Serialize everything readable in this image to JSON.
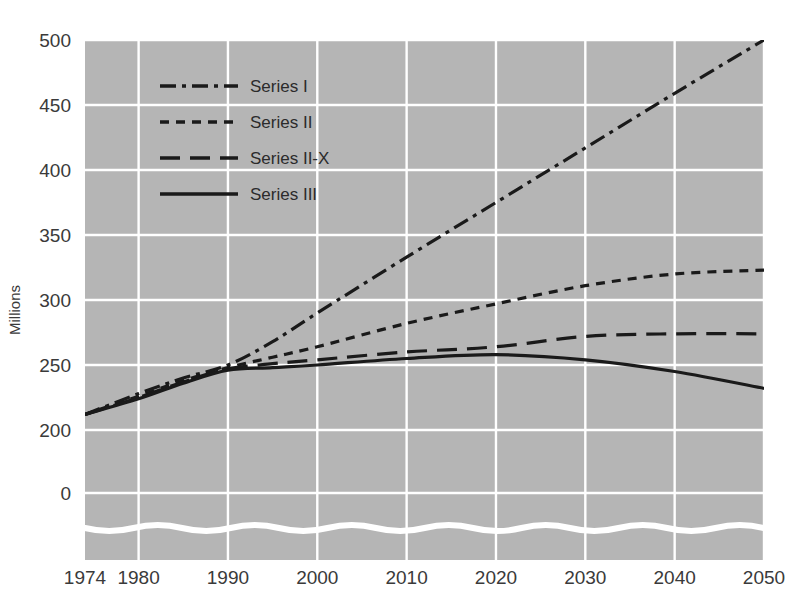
{
  "chart_data": {
    "type": "line",
    "title": "",
    "xlabel": "",
    "ylabel": "Millions",
    "xlim": [
      1974,
      2050
    ],
    "ylim": [
      190,
      500
    ],
    "yticks": [
      500,
      450,
      400,
      350,
      300,
      250,
      200,
      0
    ],
    "xticks": [
      1974,
      1980,
      1990,
      2000,
      2010,
      2020,
      2030,
      2040,
      2050
    ],
    "axis_break": true,
    "grid": true,
    "legend_position": "upper-left-inside",
    "plot_background": "#b5b5b5",
    "gridline_color": "#ffffff",
    "line_color": "#1a1a1a",
    "series": [
      {
        "name": "Series I",
        "dash_style": "dash-dot",
        "x": [
          1974,
          1980,
          1985,
          1990,
          1995,
          2000,
          2010,
          2020,
          2030,
          2040,
          2050
        ],
        "values": [
          212,
          228,
          240,
          250,
          268,
          290,
          333,
          375,
          417,
          459,
          500
        ]
      },
      {
        "name": "Series II",
        "dash_style": "short-dash",
        "x": [
          1974,
          1980,
          1985,
          1990,
          1995,
          2000,
          2010,
          2020,
          2030,
          2040,
          2050
        ],
        "values": [
          212,
          226,
          238,
          248,
          256,
          264,
          282,
          297,
          311,
          320,
          323
        ]
      },
      {
        "name": "Series II-X",
        "dash_style": "long-dash",
        "x": [
          1974,
          1980,
          1985,
          1990,
          1995,
          2000,
          2010,
          2020,
          2030,
          2040,
          2050
        ],
        "values": [
          212,
          225,
          237,
          247,
          251,
          254,
          260,
          264,
          272,
          274,
          274
        ]
      },
      {
        "name": "Series III",
        "dash_style": "solid",
        "x": [
          1974,
          1980,
          1985,
          1990,
          1995,
          2000,
          2010,
          2020,
          2030,
          2040,
          2050
        ],
        "values": [
          212,
          224,
          236,
          246,
          248,
          250,
          255,
          258,
          254,
          245,
          232
        ]
      }
    ]
  },
  "legend": {
    "items": [
      {
        "label": "Series I"
      },
      {
        "label": "Series II"
      },
      {
        "label": "Series II-X"
      },
      {
        "label": "Series III"
      }
    ]
  }
}
